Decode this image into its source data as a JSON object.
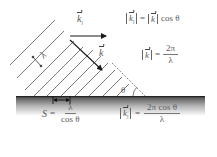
{
  "diagram": {
    "colors": {
      "lines": "#555555",
      "arrows": "#1a1a1a",
      "surface_top": "#3a3a3a",
      "surface_fade": "#ffffff",
      "text": "#5a5a5a"
    },
    "labels": {
      "k_parallel_top": "k",
      "k_parallel_sub": "||",
      "k_vector": "k",
      "lambda_wavefront": "λ",
      "theta": "θ",
      "lambda_surface": "λ"
    },
    "equations": {
      "eq1": {
        "lhs_var": "k",
        "lhs_sub": "||",
        "equals": "=",
        "rhs_var": "k",
        "rhs_tail": "cos θ"
      },
      "eq2": {
        "lhs_var": "k",
        "equals": "=",
        "numerator": "2π",
        "denominator": "λ"
      },
      "eq3": {
        "lhs": "S",
        "equals": "=",
        "numerator": "λ",
        "denominator": "cos θ"
      },
      "eq4": {
        "lhs_var": "k",
        "lhs_sub": "||",
        "equals": "=",
        "numerator": "2π cos θ",
        "denominator": "λ"
      }
    }
  }
}
